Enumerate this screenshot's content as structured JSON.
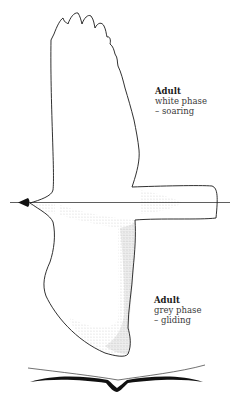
{
  "illustration": {
    "subject": "bird-in-flight",
    "upper_wing": {
      "phase": "white phase",
      "flight_mode": "soaring"
    },
    "lower_wing": {
      "phase": "grey phase",
      "flight_mode": "gliding"
    },
    "silhouette": "head-on-gliding-profile"
  },
  "captions": {
    "soaring": {
      "title": "Adult",
      "line1": "white phase",
      "line2": "– soaring"
    },
    "gliding": {
      "title": "Adult",
      "line1": "grey phase",
      "line2": "– gliding"
    }
  },
  "colors": {
    "outline": "#1a1a1a",
    "stipple": "#555555",
    "text": "#3a3a3a",
    "background": "#ffffff"
  }
}
